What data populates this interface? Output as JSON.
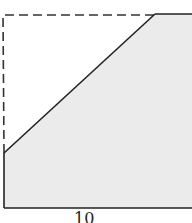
{
  "diagram": {
    "type": "geometry-figure",
    "fill_color": "#ebebeb",
    "stroke_color": "#222222",
    "dashed_color": "#333333",
    "bottom_label": "10"
  }
}
